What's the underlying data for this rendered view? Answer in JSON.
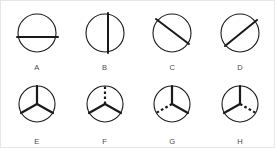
{
  "canvas": {
    "width": 275,
    "height": 148,
    "background_color": "#ffffff",
    "border_color": "#e6e6e6"
  },
  "style": {
    "stroke_color": "#1a1a1a",
    "circle_stroke_width": 1.1,
    "chord_stroke_width": 2.0,
    "spoke_stroke_width": 2.2,
    "label_color": "#4a4a4a"
  },
  "figures": [
    {
      "label": "A",
      "kind": "circle-with-chord",
      "icon_name": "circle-horizontal-chord-icon",
      "description": "Circle divided by a horizontal chord positioned slightly below center",
      "circle": {
        "cx": 26,
        "cy": 25,
        "r": 19
      },
      "lines": [
        {
          "x1": 6,
          "y1": 29,
          "x2": 47,
          "y2": 29,
          "dashed": false
        }
      ]
    },
    {
      "label": "B",
      "kind": "circle-with-chord",
      "icon_name": "circle-vertical-chord-icon",
      "description": "Circle divided by a vertical chord positioned slightly right of center",
      "circle": {
        "cx": 26,
        "cy": 25,
        "r": 19
      },
      "lines": [
        {
          "x1": 29,
          "y1": 5,
          "x2": 29,
          "y2": 45,
          "dashed": false
        }
      ]
    },
    {
      "label": "C",
      "kind": "circle-with-chord",
      "icon_name": "circle-diagonal-chord-down-icon",
      "description": "Circle crossed by a diagonal chord running from upper-left to lower-right, offset below center",
      "circle": {
        "cx": 26,
        "cy": 25,
        "r": 19
      },
      "lines": [
        {
          "x1": 10,
          "y1": 11,
          "x2": 43,
          "y2": 36,
          "dashed": false
        }
      ]
    },
    {
      "label": "D",
      "kind": "circle-with-chord",
      "icon_name": "circle-diagonal-chord-up-icon",
      "description": "Circle crossed by a diagonal chord running from lower-left to upper-right, offset above center",
      "circle": {
        "cx": 26,
        "cy": 25,
        "r": 19
      },
      "lines": [
        {
          "x1": 11,
          "y1": 38,
          "x2": 43,
          "y2": 12,
          "dashed": false
        }
      ]
    },
    {
      "label": "E",
      "kind": "circle-with-three-spokes",
      "icon_name": "circle-three-spokes-all-solid-icon",
      "description": "Circle with three radial spokes forming a Y; all three spokes solid",
      "circle": {
        "cx": 26,
        "cy": 25,
        "r": 18
      },
      "spokes": [
        {
          "name": "top",
          "x1": 26,
          "y1": 25,
          "x2": 26,
          "y2": 7,
          "dashed": false
        },
        {
          "name": "lower-left",
          "x1": 26,
          "y1": 25,
          "x2": 10,
          "y2": 34,
          "dashed": false
        },
        {
          "name": "lower-right",
          "x1": 26,
          "y1": 25,
          "x2": 42,
          "y2": 34,
          "dashed": false
        }
      ]
    },
    {
      "label": "F",
      "kind": "circle-with-three-spokes",
      "icon_name": "circle-three-spokes-top-dashed-icon",
      "description": "Circle with three radial spokes forming a Y; the top spoke is dashed",
      "circle": {
        "cx": 26,
        "cy": 25,
        "r": 18
      },
      "spokes": [
        {
          "name": "top",
          "x1": 26,
          "y1": 25,
          "x2": 26,
          "y2": 7,
          "dashed": true
        },
        {
          "name": "lower-left",
          "x1": 26,
          "y1": 25,
          "x2": 10,
          "y2": 34,
          "dashed": false
        },
        {
          "name": "lower-right",
          "x1": 26,
          "y1": 25,
          "x2": 42,
          "y2": 34,
          "dashed": false
        }
      ]
    },
    {
      "label": "G",
      "kind": "circle-with-three-spokes",
      "icon_name": "circle-three-spokes-lower-left-dashed-icon",
      "description": "Circle with three radial spokes forming a Y; the lower-left spoke is dashed",
      "circle": {
        "cx": 26,
        "cy": 25,
        "r": 18
      },
      "spokes": [
        {
          "name": "top",
          "x1": 26,
          "y1": 25,
          "x2": 26,
          "y2": 7,
          "dashed": false
        },
        {
          "name": "lower-left",
          "x1": 26,
          "y1": 25,
          "x2": 10,
          "y2": 34,
          "dashed": true
        },
        {
          "name": "lower-right",
          "x1": 26,
          "y1": 25,
          "x2": 42,
          "y2": 34,
          "dashed": false
        }
      ]
    },
    {
      "label": "H",
      "kind": "circle-with-three-spokes",
      "icon_name": "circle-three-spokes-lower-right-dashed-icon",
      "description": "Circle with three radial spokes forming a Y; the lower-right spoke is dashed",
      "circle": {
        "cx": 26,
        "cy": 25,
        "r": 18
      },
      "spokes": [
        {
          "name": "top",
          "x1": 26,
          "y1": 25,
          "x2": 26,
          "y2": 7,
          "dashed": false
        },
        {
          "name": "lower-left",
          "x1": 26,
          "y1": 25,
          "x2": 10,
          "y2": 34,
          "dashed": false
        },
        {
          "name": "lower-right",
          "x1": 26,
          "y1": 25,
          "x2": 42,
          "y2": 34,
          "dashed": true
        }
      ]
    }
  ]
}
